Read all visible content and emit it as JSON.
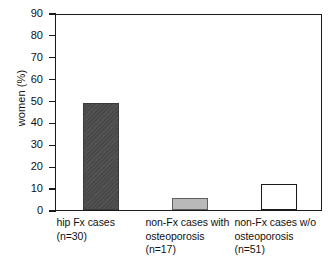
{
  "chart_data": {
    "type": "bar",
    "title": "",
    "xlabel": "",
    "ylabel": "women (%)",
    "ylim": [
      0,
      90
    ],
    "yticks": [
      0,
      10,
      20,
      30,
      40,
      50,
      60,
      70,
      80,
      90
    ],
    "ytick_labels": [
      "0",
      "10",
      "20",
      "30",
      "40",
      "50",
      "60",
      "70",
      "80",
      "90"
    ],
    "grid": false,
    "legend": "none",
    "categories": [
      "hip Fx cases (n=30)",
      "non-Fx cases with osteoporosis (n=17)",
      "non-Fx cases w/o osteoporosis (n=51)"
    ],
    "category_lines": [
      [
        "hip Fx cases",
        "(n=30)"
      ],
      [
        "non-Fx cases with",
        "osteoporosis",
        "(n=17)"
      ],
      [
        "non-Fx cases w/o",
        "osteoporosis",
        "(n=51)"
      ]
    ],
    "values": [
      49,
      5.5,
      12
    ],
    "bar_styles": [
      "dark-gray-solid",
      "light-gray-solid",
      "white-outline"
    ],
    "bar_colors": [
      "#4a4a4a",
      "#b9b9b9",
      "#ffffff"
    ],
    "bar_edge_color": "#1a1a1a",
    "axis_color": "#1a1a1a",
    "background_color": "#ffffff",
    "sample_sizes": [
      "n=30",
      "n=17",
      "n=51"
    ]
  },
  "axis": {
    "ylabel": "women (%)"
  }
}
